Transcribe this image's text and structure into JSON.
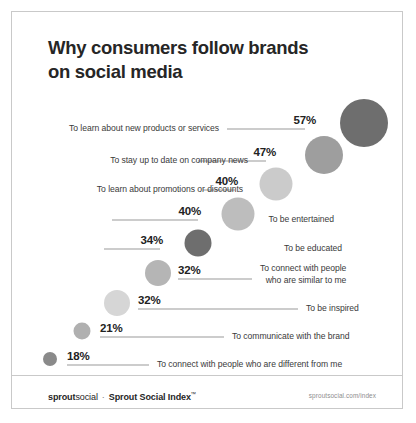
{
  "title": {
    "line1": "Why consumers follow brands",
    "line2": "on social media"
  },
  "footer": {
    "brand_bold": "sprout",
    "brand_rest": "social",
    "separator": "·",
    "index_label": "Sprout Social Index",
    "trademark": "™",
    "site": "sproutsocial.com/index"
  },
  "chart_data": {
    "type": "bar",
    "title": "Why consumers follow brands on social media",
    "subtitle": "",
    "xlabel": "",
    "ylabel": "",
    "xlim": [
      0,
      60
    ],
    "grid": false,
    "legend": "none",
    "note": "Bubble-and-leader chart; bubble area and gray tone scale with the percentage.",
    "categories": [
      "To learn about new products or services",
      "To stay up to date on company news",
      "To learn about promotions or discounts",
      "To be entertained",
      "To be educated",
      "To connect with people who are similar to me",
      "To be inspired",
      "To communicate with the brand",
      "To connect with people who are different from me"
    ],
    "values": [
      57,
      47,
      40,
      40,
      34,
      32,
      32,
      21,
      18
    ],
    "value_labels": [
      "57%",
      "47%",
      "40%",
      "40%",
      "34%",
      "32%",
      "32%",
      "21%",
      "18%"
    ],
    "colors": [
      "#6e6e6e",
      "#9e9e9e",
      "#cbcbcb",
      "#bdbdbd",
      "#6e6e6e",
      "#b5b5b5",
      "#d6d6d6",
      "#b0b0b0",
      "#8a8a8a"
    ]
  },
  "rows": [
    {
      "label": "To learn about new products or services",
      "label2": "",
      "value": "57%",
      "side": "left",
      "color": "#6e6e6e",
      "y": 111,
      "bubble_cx": 352,
      "bubble_r": 24,
      "pct_right": 88,
      "leader_x": 215,
      "leader_w": 78,
      "label_right": 185
    },
    {
      "label": "To stay up to date on company news",
      "label2": "",
      "value": "47%",
      "side": "left",
      "color": "#9e9e9e",
      "y": 143,
      "bubble_cx": 312,
      "bubble_r": 19,
      "pct_right": 128,
      "leader_x": 186,
      "leader_w": 68,
      "label_right": 156
    },
    {
      "label": "To learn about promotions or discounts",
      "label2": "",
      "value": "40%",
      "side": "left",
      "color": "#cbcbcb",
      "y": 172,
      "bubble_cx": 264,
      "bubble_r": 16.5,
      "pct_right": 166,
      "leader_x": 191,
      "leader_w": 32,
      "label_right": 161
    },
    {
      "label": "To be entertained",
      "label2": "",
      "value": "40%",
      "side": "left",
      "color": "#bdbdbd",
      "y": 202,
      "bubble_cx": 226,
      "bubble_r": 16.5,
      "pct_right": 203,
      "leader_x": 100,
      "leader_w": 86,
      "label_right": 70
    },
    {
      "label": "To be educated",
      "label2": "",
      "value": "34%",
      "side": "left",
      "color": "#6e6e6e",
      "y": 231,
      "bubble_cx": 186,
      "bubble_r": 13.5,
      "pct_right": 241,
      "leader_x": 92,
      "leader_w": 56,
      "label_right": 62
    },
    {
      "label": "To connect with people",
      "label2": "who are similar to me",
      "value": "32%",
      "side": "right",
      "color": "#b5b5b5",
      "y": 261,
      "bubble_cx": 146,
      "bubble_r": 13,
      "pct_left": 166,
      "leader_x": 166,
      "leader_w": 74,
      "label_left": 248
    },
    {
      "label": "To be inspired",
      "label2": "",
      "value": "32%",
      "side": "right",
      "color": "#d6d6d6",
      "y": 291,
      "bubble_cx": 105,
      "bubble_r": 13,
      "pct_left": 126,
      "leader_x": 126,
      "leader_w": 160,
      "label_left": 294
    },
    {
      "label": "To communicate with the brand",
      "label2": "",
      "value": "21%",
      "side": "right",
      "color": "#b0b0b0",
      "y": 319,
      "bubble_cx": 70,
      "bubble_r": 8.5,
      "pct_left": 88,
      "leader_x": 88,
      "leader_w": 124,
      "label_left": 220
    },
    {
      "label": "To connect with people who are different from me",
      "label2": "",
      "value": "18%",
      "side": "right",
      "color": "#8a8a8a",
      "y": 347,
      "bubble_cx": 38,
      "bubble_r": 7,
      "pct_left": 55,
      "leader_x": 55,
      "leader_w": 82,
      "label_left": 145
    }
  ]
}
